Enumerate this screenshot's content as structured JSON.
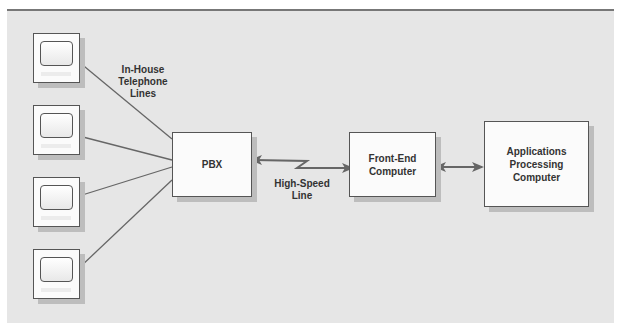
{
  "diagram": {
    "terminals": [
      {
        "id": "terminal-1"
      },
      {
        "id": "terminal-2"
      },
      {
        "id": "terminal-3"
      },
      {
        "id": "terminal-4"
      }
    ],
    "labels": {
      "telephone_lines": [
        "In-House",
        "Telephone",
        "Lines"
      ],
      "high_speed_line": [
        "High-Speed",
        "Line"
      ]
    },
    "nodes": {
      "pbx": "PBX",
      "front_end": [
        "Front-End",
        "Computer"
      ],
      "applications": [
        "Applications",
        "Processing",
        "Computer"
      ]
    },
    "colors": {
      "background": "#e6e6e6",
      "box_fill": "#fbfbfb",
      "line": "#666666",
      "shadow": "#bdbdbd",
      "text": "#333333"
    }
  }
}
